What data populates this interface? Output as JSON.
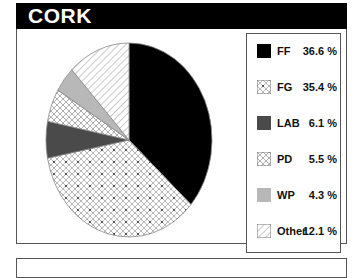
{
  "header": {
    "title": "CORK"
  },
  "chart_data": {
    "type": "pie",
    "title": "CORK",
    "categories": [
      "FF",
      "FG",
      "LAB",
      "PD",
      "WP",
      "Other"
    ],
    "values": [
      36.6,
      35.4,
      6.1,
      5.5,
      4.3,
      12.1
    ],
    "unit": "%",
    "legend_position": "right",
    "start_angle": "12 o'clock, clockwise",
    "slice_styles": {
      "FF": "solid black",
      "FG": "crosshatch with dots",
      "LAB": "solid dark gray",
      "PD": "crosshatch",
      "WP": "solid light gray",
      "Other": "diagonal hatch"
    }
  },
  "legend": {
    "items": [
      {
        "label": "FF",
        "value": "36.6 %"
      },
      {
        "label": "FG",
        "value": "35.4 %"
      },
      {
        "label": "LAB",
        "value": "6.1 %"
      },
      {
        "label": "PD",
        "value": "5.5 %"
      },
      {
        "label": "WP",
        "value": "4.3 %"
      },
      {
        "label": "Other",
        "value": "12.1 %"
      }
    ]
  },
  "colors": {
    "ff": "#000000",
    "lab": "#4a4a4a",
    "wp": "#b8b8b8",
    "outline": "#555555"
  }
}
